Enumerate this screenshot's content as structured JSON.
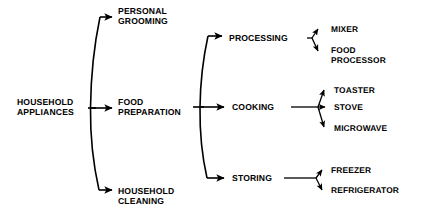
{
  "diagram": {
    "type": "hierarchical-tree",
    "orientation": "left-to-right",
    "title": "",
    "background_color": "#ffffff",
    "line_color": "#000000",
    "text_color": "#000000",
    "root": {
      "label_line1": "HOUSEHOLD",
      "label_line2": "APPLIANCES"
    },
    "level1": [
      {
        "id": "personal-grooming",
        "label_line1": "PERSONAL",
        "label_line2": "GROOMING"
      },
      {
        "id": "food-preparation",
        "label_line1": "FOOD",
        "label_line2": "PREPARATION"
      },
      {
        "id": "household-cleaning",
        "label_line1": "HOUSEHOLD",
        "label_line2": "CLEANING"
      }
    ],
    "level2": [
      {
        "id": "processing",
        "label": "PROCESSING",
        "parent": "food-preparation"
      },
      {
        "id": "cooking",
        "label": "COOKING",
        "parent": "food-preparation"
      },
      {
        "id": "storing",
        "label": "STORING",
        "parent": "food-preparation"
      }
    ],
    "level3": {
      "processing": [
        {
          "id": "mixer",
          "label_line1": "MIXER",
          "label_line2": ""
        },
        {
          "id": "food-processor",
          "label_line1": "FOOD",
          "label_line2": "PROCESSOR"
        }
      ],
      "cooking": [
        {
          "id": "toaster",
          "label_line1": "TOASTER",
          "label_line2": ""
        },
        {
          "id": "stove",
          "label_line1": "STOVE",
          "label_line2": ""
        },
        {
          "id": "microwave",
          "label_line1": "MICROWAVE",
          "label_line2": ""
        }
      ],
      "storing": [
        {
          "id": "freezer",
          "label_line1": "FREEZER",
          "label_line2": ""
        },
        {
          "id": "refrigerator",
          "label_line1": "REFRIGERATOR",
          "label_line2": ""
        }
      ]
    }
  }
}
